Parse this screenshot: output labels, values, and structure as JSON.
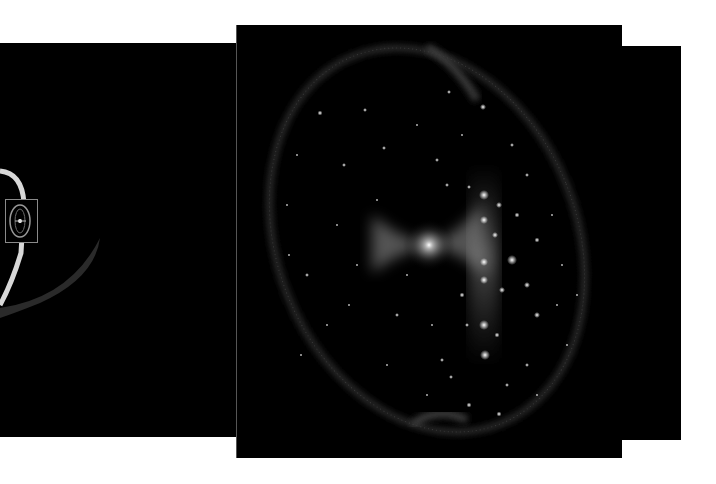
{
  "figure": {
    "background": "#ffffff",
    "panels": [
      {
        "id": "left",
        "label": "zoomed-out view",
        "x": 0,
        "y": 43,
        "w": 240,
        "h": 394
      },
      {
        "id": "main",
        "label": "zoomed-in view",
        "x": 236,
        "y": 25,
        "w": 385,
        "h": 433
      },
      {
        "id": "right",
        "label": "back panel",
        "x": 620,
        "y": 46,
        "w": 61,
        "h": 394
      }
    ],
    "inset_box": {
      "x": 5,
      "y": 199,
      "w": 32,
      "h": 43
    },
    "colors": {
      "panel_bg": "#000000",
      "ring": "#d8d8d8",
      "glow": "#9a9a9a",
      "star": "#e8e8e8",
      "inset_outline": "#8a8a8a"
    }
  }
}
